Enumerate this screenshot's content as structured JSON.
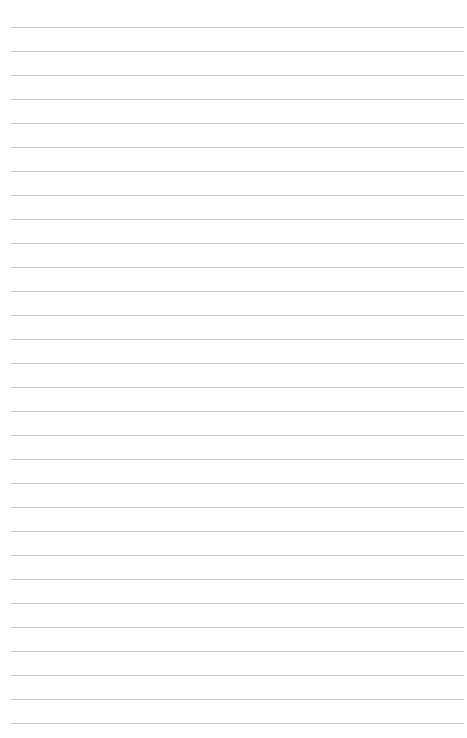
{
  "page": {
    "type": "lined-paper",
    "line_count": 30,
    "first_line_y": 27,
    "line_spacing": 24,
    "line_color": "#c9c9c9",
    "background": "#ffffff"
  }
}
